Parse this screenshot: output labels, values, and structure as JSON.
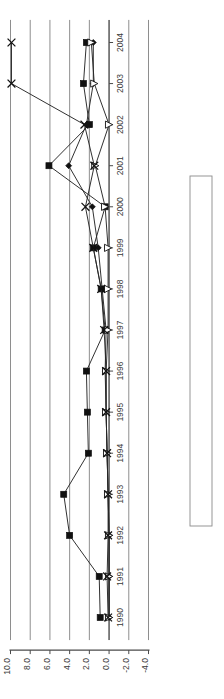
{
  "chart_data": {
    "type": "line",
    "title": "",
    "subtitle": "",
    "xlabel": "",
    "ylabel": "",
    "orientation": "rotated-90-ccw",
    "grid": true,
    "legend_position": "right",
    "categories": [
      "1990",
      "1991",
      "1992",
      "1993",
      "1994",
      "1995",
      "1996",
      "1997",
      "1998",
      "1999",
      "2000",
      "2001",
      "2002",
      "2003",
      "2004"
    ],
    "x": [
      1990,
      1991,
      1992,
      1993,
      1994,
      1995,
      1996,
      1997,
      1998,
      1999,
      2000,
      2001,
      2002,
      2003,
      2004
    ],
    "value_ticks": [
      "10.0",
      "8.0",
      "6.0",
      "4.0",
      "2.0",
      "0.0",
      "-2.0",
      "-4.0"
    ],
    "value_tick_numbers": [
      10.0,
      8.0,
      6.0,
      4.0,
      2.0,
      0.0,
      -2.0,
      -4.0
    ],
    "ylim": [
      -4.0,
      10.0
    ],
    "series": [
      {
        "name": "Brazil",
        "marker": "filled-diamond",
        "values": [
          0.0,
          0.0,
          0.0,
          0.1,
          0.2,
          0.3,
          0.4,
          0.3,
          0.7,
          1.1,
          1.7,
          4.1,
          2.3,
          1.6,
          1.6
        ]
      },
      {
        "name": "China",
        "marker": "filled-square",
        "values": [
          0.9,
          1.0,
          4.0,
          4.6,
          2.1,
          2.2,
          2.3,
          0.4,
          0.8,
          1.6,
          0.4,
          6.1,
          2.0,
          2.6,
          2.3
        ]
      },
      {
        "name": "India",
        "marker": "open-triangle",
        "values": [
          0.0,
          0.0,
          0.0,
          0.1,
          0.2,
          0.3,
          0.3,
          0.1,
          0.1,
          0.1,
          0.4,
          1.4,
          0.0,
          1.5,
          1.8
        ]
      },
      {
        "name": "Russian Federation",
        "marker": "x-cross",
        "values": [
          0.1,
          0.2,
          0.1,
          0.1,
          0.2,
          0.3,
          0.3,
          0.5,
          0.8,
          1.6,
          2.4,
          1.5,
          2.5,
          9.9,
          9.9
        ]
      }
    ],
    "legend_entries": [
      {
        "label": "Brazil",
        "marker": "filled-diamond"
      },
      {
        "label": "China",
        "marker": "filled-square"
      },
      {
        "label": "India",
        "marker": "open-triangle"
      },
      {
        "label": "Russian Federation",
        "marker": "x-cross"
      }
    ],
    "colors": {
      "series_stroke": "#262626",
      "gridline": "#8e8e8e",
      "axis": "#4a4a4a",
      "text": "#3a3a3a",
      "background": "#ffffff"
    }
  }
}
